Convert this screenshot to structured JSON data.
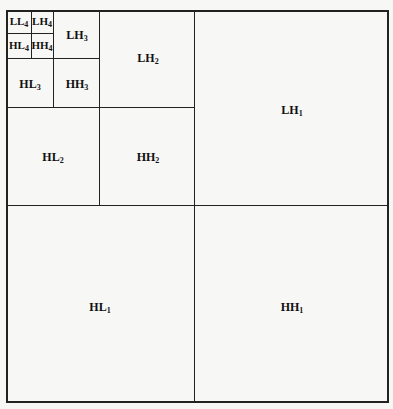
{
  "diagram": {
    "type": "wavelet-decomposition-4-level",
    "subbands": [
      {
        "id": "LL4",
        "base": "LL",
        "sub": "4",
        "x": 19,
        "y": 22
      },
      {
        "id": "LH4",
        "base": "LH",
        "sub": "4",
        "x": 42,
        "y": 22
      },
      {
        "id": "HL4",
        "base": "HL",
        "sub": "4",
        "x": 19,
        "y": 46
      },
      {
        "id": "HH4",
        "base": "HH",
        "sub": "4",
        "x": 42,
        "y": 46
      },
      {
        "id": "LH3",
        "base": "LH",
        "sub": "3",
        "x": 77,
        "y": 35
      },
      {
        "id": "HL3",
        "base": "HL",
        "sub": "3",
        "x": 30,
        "y": 84
      },
      {
        "id": "HH3",
        "base": "HH",
        "sub": "3",
        "x": 77,
        "y": 84
      },
      {
        "id": "LH2",
        "base": "LH",
        "sub": "2",
        "x": 148,
        "y": 58
      },
      {
        "id": "HL2",
        "base": "HL",
        "sub": "2",
        "x": 53,
        "y": 157
      },
      {
        "id": "HH2",
        "base": "HH",
        "sub": "2",
        "x": 148,
        "y": 157
      },
      {
        "id": "LH1",
        "base": "LH",
        "sub": "1",
        "x": 292,
        "y": 110
      },
      {
        "id": "HL1",
        "base": "HL",
        "sub": "1",
        "x": 100,
        "y": 307
      },
      {
        "id": "HH1",
        "base": "HH",
        "sub": "1",
        "x": 292,
        "y": 307
      }
    ]
  }
}
